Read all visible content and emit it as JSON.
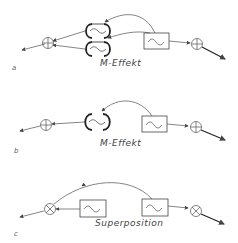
{
  "panels": [
    {
      "id": "a",
      "letter": "a",
      "caption": "M-Effekt",
      "elements": [
        "summing-junction-left",
        "double-mixer-loops",
        "oscillator-box",
        "summing-junction-right"
      ]
    },
    {
      "id": "b",
      "letter": "b",
      "caption": "M-Effekt",
      "elements": [
        "summing-junction-left",
        "mixer-loop",
        "oscillator-box",
        "summing-junction-right"
      ]
    },
    {
      "id": "c",
      "letter": "c",
      "caption": "Superposition",
      "elements": [
        "multiplier-left",
        "oscillator-box-left",
        "oscillator-box-right",
        "multiplier-right"
      ]
    }
  ],
  "colors": {
    "line": "#555555",
    "bold": "#222222",
    "text": "#444444"
  }
}
